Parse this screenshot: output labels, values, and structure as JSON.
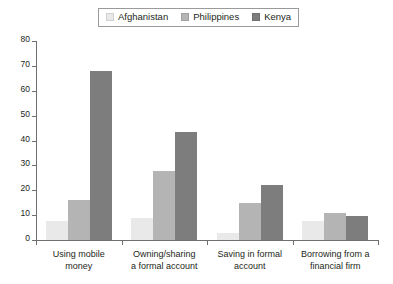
{
  "chart_data": {
    "type": "bar",
    "title": "",
    "subtitle": "",
    "xlabel": "",
    "ylabel": "",
    "ylim": [
      0,
      80
    ],
    "yticks": [
      0,
      10,
      20,
      30,
      40,
      50,
      60,
      70,
      80
    ],
    "grid": false,
    "legend_position": "top-center",
    "orientation": "vertical",
    "grouping": "grouped",
    "categories": [
      "Using mobile\nmoney",
      "Owning/sharing\na formal account",
      "Saving in formal\naccount",
      "Borrowing from a\nfinancial firm"
    ],
    "series": [
      {
        "name": "Afghanistan",
        "color": "#e9e9e9",
        "values": [
          7.6,
          9.0,
          2.8,
          7.7
        ]
      },
      {
        "name": "Philippines",
        "color": "#b4b4b4",
        "values": [
          16.0,
          27.7,
          15.0,
          11.0
        ]
      },
      {
        "name": "Kenya",
        "color": "#7d7d7d",
        "values": [
          68.0,
          43.5,
          22.0,
          9.5
        ]
      }
    ]
  },
  "legend": {
    "entries": [
      {
        "label": "Afghanistan",
        "swatch": "#e9e9e9"
      },
      {
        "label": "Philippines",
        "swatch": "#b4b4b4"
      },
      {
        "label": "Kenya",
        "swatch": "#7d7d7d"
      }
    ]
  },
  "axis": {
    "y_tick_labels": [
      "0",
      "10",
      "20",
      "30",
      "40",
      "50",
      "60",
      "70",
      "80"
    ]
  }
}
